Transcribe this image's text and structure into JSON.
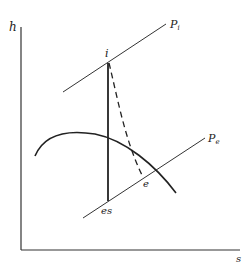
{
  "diagram": {
    "type": "h-s (Mollier) diagram",
    "axes": {
      "y_label": "h",
      "x_label": "s"
    },
    "isobars": [
      {
        "id": "inlet",
        "label": "P",
        "subscript": "i"
      },
      {
        "id": "exit",
        "label": "P",
        "subscript": "e"
      }
    ],
    "points": [
      {
        "id": "i",
        "label": "i"
      },
      {
        "id": "es",
        "label": "es"
      },
      {
        "id": "e",
        "label": "e"
      }
    ],
    "curves": [
      {
        "id": "saturation-dome",
        "style": "solid"
      },
      {
        "id": "isentropic-expansion",
        "from": "i",
        "to": "es",
        "style": "solid"
      },
      {
        "id": "actual-expansion",
        "from": "i",
        "to": "e",
        "style": "dashed"
      }
    ],
    "colors": {
      "line": "#222222",
      "background": "#ffffff"
    }
  }
}
